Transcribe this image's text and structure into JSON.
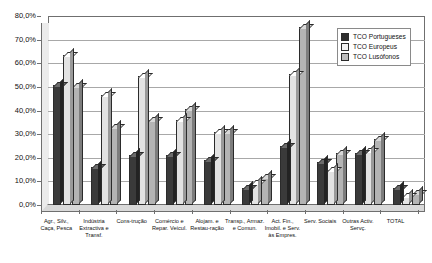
{
  "chart_data": {
    "type": "bar",
    "title": "",
    "subtitle": "",
    "xlabel": "",
    "ylabel": "",
    "ylim": [
      0,
      80
    ],
    "ytick_labels": [
      "80,0%",
      "70,0%",
      "60,0%",
      "50,0%",
      "40,0%",
      "30,0%",
      "20,0%",
      "10,0%",
      "0,0%"
    ],
    "ytick_values": [
      80,
      70,
      60,
      50,
      40,
      30,
      20,
      10,
      0
    ],
    "grid": true,
    "legend_position": "top-right",
    "categories": [
      "Agr., Silv., Caça, Pesca",
      "Indústria Extractiva e Transf.",
      "Cons-trução",
      "Comércio e Repar. Veícul.",
      "Alojam. e Restau-ração",
      "Transp., Armaz. e Comun.",
      "Act. Fin., Imobil. e Serv. às Empres.",
      "Serv. Sociais",
      "Outras Activ. Servç.",
      "TOTAL"
    ],
    "series": [
      {
        "name": "TCO Portugueses",
        "color": "#3a3a3a",
        "values": [
          51.0,
          16.0,
          21.0,
          21.0,
          19.0,
          7.0,
          25.0,
          18.0,
          22.0,
          7.0
        ]
      },
      {
        "name": "TCO Europeus",
        "color": "#e3e3e3",
        "values": [
          63.5,
          46.5,
          54.5,
          36.0,
          31.0,
          9.5,
          55.5,
          15.0,
          23.0,
          4.0
        ]
      },
      {
        "name": "TCO Lusófonos",
        "color": "#b4b4b4",
        "values": [
          50.5,
          33.0,
          36.0,
          40.5,
          31.0,
          12.0,
          75.5,
          22.0,
          28.0,
          5.0
        ]
      }
    ]
  },
  "legend": {
    "items": [
      {
        "label": "TCO Portugueses"
      },
      {
        "label": "TCO Europeus"
      },
      {
        "label": "TCO Lusófonos"
      }
    ]
  }
}
